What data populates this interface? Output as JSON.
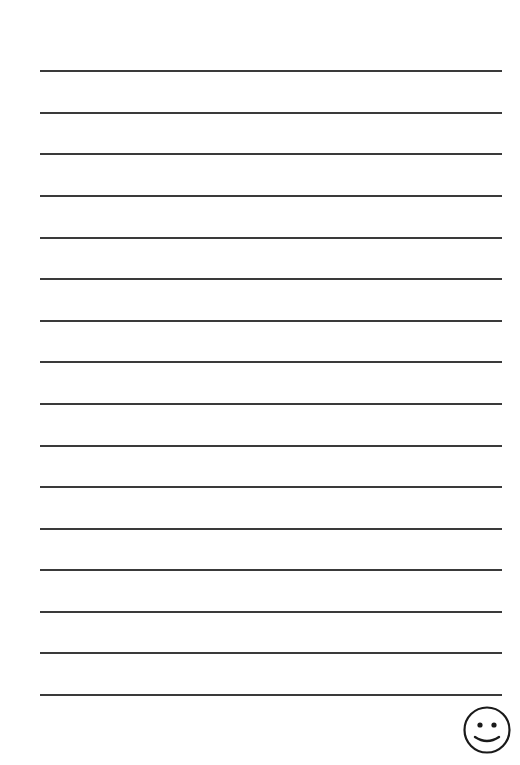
{
  "page": {
    "type": "lined-writing-paper",
    "line_count": 16,
    "line_color": "#3a3a3a",
    "line_positions_y": [
      71,
      113,
      154,
      196,
      238,
      279,
      321,
      362,
      404,
      446,
      487,
      529,
      570,
      612,
      653,
      695
    ]
  },
  "footer": {
    "icon": "smiley-face-icon"
  }
}
